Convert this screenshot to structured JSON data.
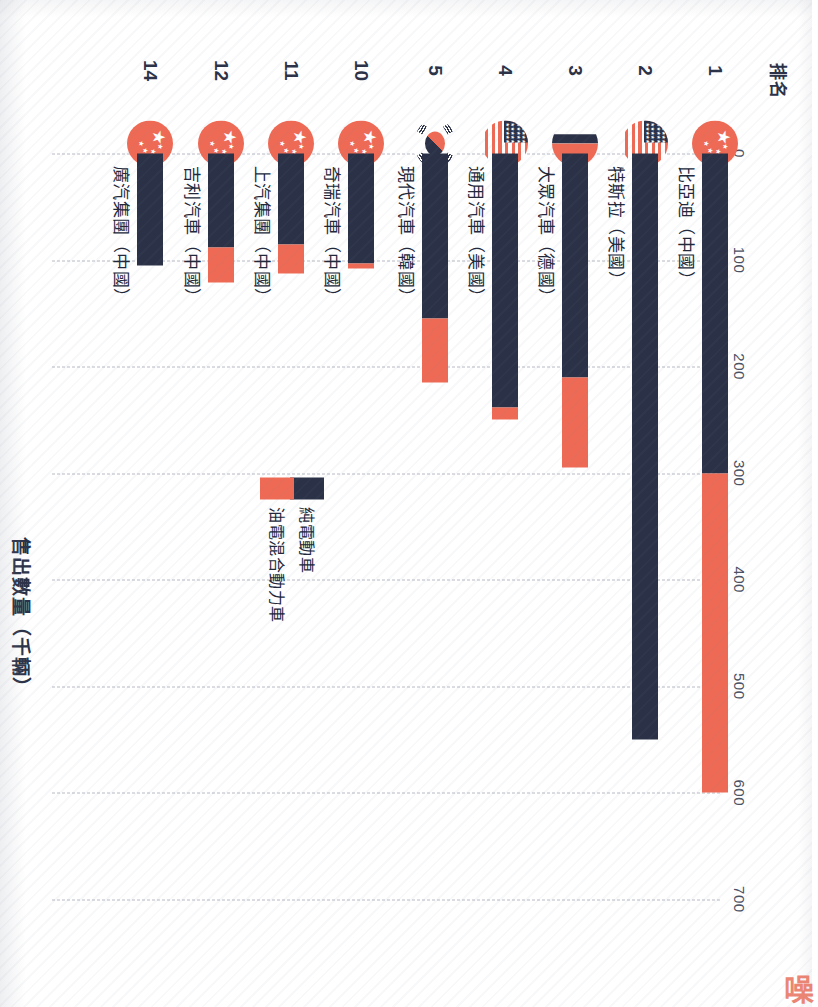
{
  "chart_data": {
    "type": "bar",
    "orientation": "horizontal-rotated",
    "title": "",
    "xlabel": "售出數量（千輛）",
    "ylabel": "排名",
    "xlim": [
      0,
      760
    ],
    "xticks": [
      0,
      100,
      200,
      300,
      400,
      500,
      600,
      700
    ],
    "xtick_labels": [
      "0",
      "100",
      "200",
      "300",
      "400",
      "500",
      "600",
      "700"
    ],
    "grid": true,
    "legend_position": "inside-lower-left",
    "stacked": true,
    "categories": [
      "比亞迪（中國）",
      "特斯拉（美國）",
      "大眾汽車（德國）",
      "通用汽車（美國）",
      "現代汽車（韓國）",
      "奇瑞汽車（中國）",
      "上汽集團（中國）",
      "吉利汽車（中國）",
      "廣汽集團（中國）"
    ],
    "ranks": [
      "1",
      "2",
      "3",
      "4",
      "5",
      "10",
      "11",
      "12",
      "14"
    ],
    "flags": [
      "cn",
      "us",
      "de",
      "us",
      "kr",
      "cn",
      "cn",
      "cn",
      "cn"
    ],
    "series": [
      {
        "name": "純電動車",
        "color": "#2b3247",
        "values": [
          300,
          550,
          210,
          238,
          155,
          103,
          85,
          88,
          105
        ]
      },
      {
        "name": "油電混合動力車",
        "color": "#ef6a55",
        "values": [
          300,
          0,
          85,
          12,
          60,
          5,
          28,
          33,
          0
        ]
      }
    ],
    "totals": [
      600,
      550,
      295,
      250,
      215,
      108,
      113,
      121,
      105
    ]
  },
  "legend": {
    "items": [
      {
        "label": "純電動車",
        "color": "#2b3247"
      },
      {
        "label": "油電混合動力車",
        "color": "#ef6a55"
      }
    ]
  },
  "axis": {
    "value_axis_title": "售出數量（千輛）",
    "rank_axis_title": "排名"
  },
  "watermark": {
    "glyph": "噪"
  },
  "colors": {
    "bev": "#2b3247",
    "phev": "#ef6a55",
    "text": "#22283a",
    "grid": "#aab0bd",
    "paper": "#ffffff"
  }
}
